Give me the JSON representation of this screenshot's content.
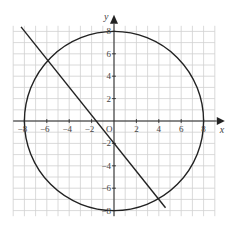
{
  "chart_data": {
    "type": "line",
    "title": "",
    "xlabel": "x",
    "ylabel": "y",
    "origin_label": "O",
    "xlim": [
      -9,
      9
    ],
    "ylim": [
      -8.5,
      8.5
    ],
    "grid": true,
    "grid_step": 1,
    "x_ticks": [
      -8,
      -6,
      -4,
      -2,
      2,
      4,
      6,
      8
    ],
    "x_tick_labels": [
      "−8",
      "−6",
      "−4",
      "−2",
      "2",
      "4",
      "6",
      "8"
    ],
    "y_ticks": [
      8,
      6,
      4,
      2,
      -2,
      -4,
      -6,
      -8
    ],
    "y_tick_labels": [
      "8",
      "6",
      "4",
      "2",
      "−2",
      "−4",
      "−6",
      "−8"
    ],
    "series": [
      {
        "name": "circle",
        "shape": "circle",
        "equation": "x² + y² = 64",
        "center": [
          0,
          0
        ],
        "radius": 8
      },
      {
        "name": "line",
        "shape": "segment",
        "equation": "y = −1.25x − 2",
        "points": [
          [
            -8.3,
            8.4
          ],
          [
            4.6,
            -7.75
          ]
        ]
      }
    ],
    "intersections": [
      [
        -6,
        5.5
      ],
      [
        4,
        -7
      ]
    ],
    "colors": {
      "curve": "#222222",
      "grid": "#d0d0d0",
      "axis": "#222222",
      "text": "#444444"
    }
  }
}
